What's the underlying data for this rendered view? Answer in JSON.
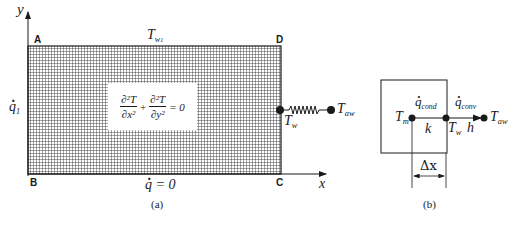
{
  "panel_a": {
    "caption": "(a)",
    "axis_y_label": "y",
    "axis_x_label": "x",
    "corners": {
      "A": "A",
      "B": "B",
      "C": "C",
      "D": "D"
    },
    "top_boundary_label": {
      "main": "T",
      "sub": "w",
      "subsub": "1"
    },
    "left_boundary_label": {
      "main": "q",
      "sub": "1"
    },
    "bottom_boundary_label": "q = 0",
    "right_wall_temp": {
      "main": "T",
      "sub": "w"
    },
    "ambient_temp": {
      "main": "T",
      "sub": "aw"
    },
    "equation": {
      "term1_num": "∂²T",
      "term1_den": "∂x²",
      "plus": "+",
      "term2_num": "∂²T",
      "term2_den": "∂y²",
      "rhs": "= 0"
    },
    "colors": {
      "grid_fill": "#8a8a8a",
      "grid_line": "#2a2a2a",
      "ink": "#1a1a1a"
    }
  },
  "panel_b": {
    "caption": "(b)",
    "node_m": {
      "main": "T",
      "sub": "m"
    },
    "node_w": {
      "main": "T",
      "sub": "w"
    },
    "node_aw": {
      "main": "T",
      "sub": "aw"
    },
    "q_cond": {
      "main": "q",
      "sub": "cond"
    },
    "q_conv": {
      "main": "q",
      "sub": "conv"
    },
    "conductivity": "k",
    "convection_coeff": "h",
    "spacing": "Δx"
  }
}
